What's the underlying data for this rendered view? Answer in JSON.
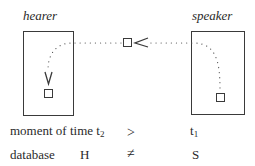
{
  "diagram": {
    "hearer": {
      "label": "hearer"
    },
    "speaker": {
      "label": "speaker"
    },
    "message": {
      "shape": "square",
      "arrow": "<"
    },
    "rows": [
      {
        "label": "moment of time",
        "label_sub": "t",
        "label_sub_index": "2",
        "relation": ">",
        "right": "t",
        "right_index": "1"
      },
      {
        "label": "database",
        "left": "H",
        "relation": "≠",
        "right": "S"
      }
    ]
  },
  "colors": {
    "stroke": "#3a3a3a",
    "text": "#2a2a2a",
    "dots": "#555555"
  }
}
